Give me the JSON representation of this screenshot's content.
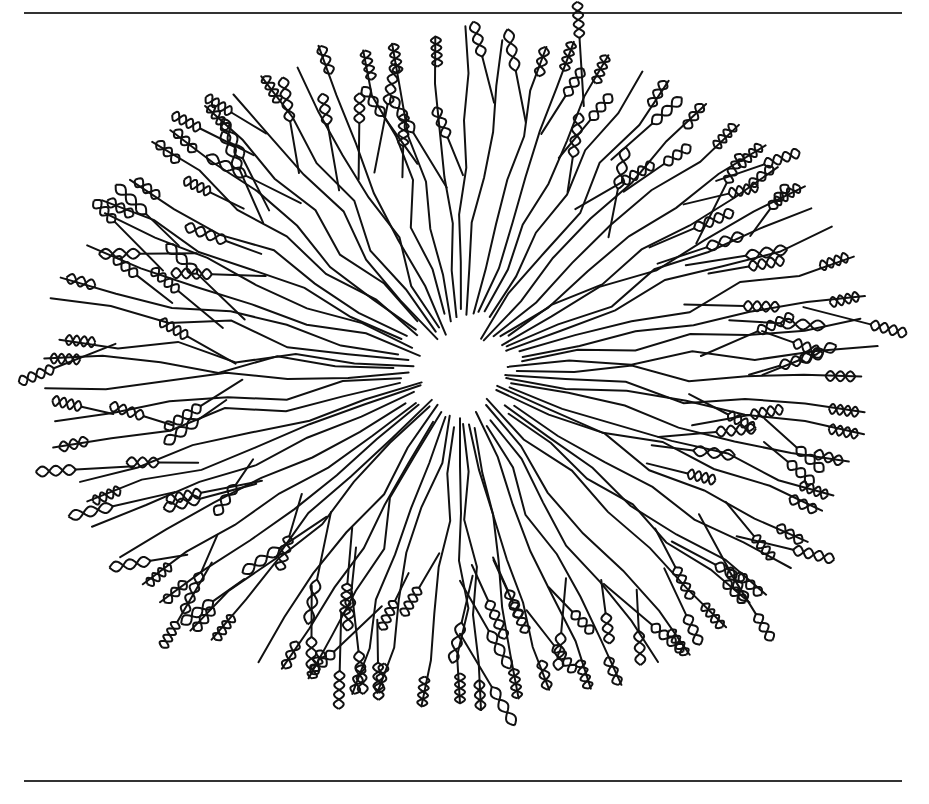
{
  "figure": {
    "colors": {
      "ink": "#111111",
      "background": "#ffffff",
      "rule": "#333333"
    },
    "center": [
      460,
      370
    ],
    "radii": [
      420,
      345
    ],
    "branch_count": 72,
    "helix_count": 110
  }
}
